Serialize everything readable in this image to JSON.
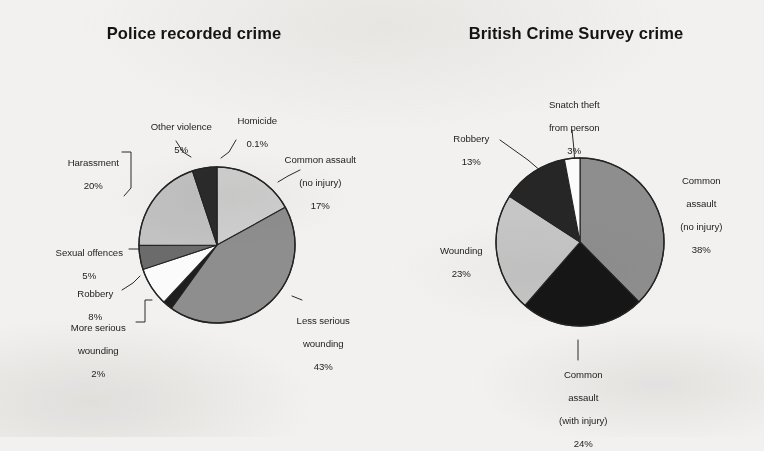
{
  "page": {
    "background_color": "#f2f1ef",
    "ink_color": "#1b1b1b"
  },
  "charts": [
    {
      "id": "police-recorded-crime",
      "title": "Police recorded crime",
      "slices": [
        {
          "label_line1": "Common assault",
          "label_line2": "(no injury)",
          "value_text": "17%",
          "value": 17,
          "color": "#cfcfcf"
        },
        {
          "label_line1": "Less serious",
          "label_line2": "wounding",
          "value_text": "43%",
          "value": 43,
          "color": "#8e8e8e"
        },
        {
          "label_line1": "More serious",
          "label_line2": "wounding",
          "value_text": "2%",
          "value": 2,
          "color": "#1e1e1e"
        },
        {
          "label_line1": "Robbery",
          "label_line2": "",
          "value_text": "8%",
          "value": 8,
          "color": "#fbfbfb"
        },
        {
          "label_line1": "Sexual offences",
          "label_line2": "",
          "value_text": "5%",
          "value": 5,
          "color": "#6b6b6b"
        },
        {
          "label_line1": "Harassment",
          "label_line2": "",
          "value_text": "20%",
          "value": 20,
          "color": "#c2c2c2"
        },
        {
          "label_line1": "Other violence",
          "label_line2": "",
          "value_text": "5%",
          "value": 5,
          "color": "#2b2b2b"
        },
        {
          "label_line1": "Homicide",
          "label_line2": "",
          "value_text": "0.1%",
          "value": 0.1,
          "color": "#4a4a4a"
        }
      ]
    },
    {
      "id": "british-crime-survey-crime",
      "title": "British Crime Survey crime",
      "slices": [
        {
          "label_line1": "Common",
          "label_line2": "assault",
          "label_line3": "(no injury)",
          "value_text": "38%",
          "value": 38,
          "color": "#8e8e8e"
        },
        {
          "label_line1": "Common",
          "label_line2": "assault",
          "label_line3": "(with injury)",
          "value_text": "24%",
          "value": 24,
          "color": "#161616"
        },
        {
          "label_line1": "Wounding",
          "label_line2": "",
          "label_line3": "",
          "value_text": "23%",
          "value": 23,
          "color": "#c6c6c6"
        },
        {
          "label_line1": "Robbery",
          "label_line2": "",
          "label_line3": "",
          "value_text": "13%",
          "value": 13,
          "color": "#262626"
        },
        {
          "label_line1": "Snatch theft",
          "label_line2": "from person",
          "label_line3": "",
          "value_text": "3%",
          "value": 3,
          "color": "#fbfbfb"
        }
      ]
    }
  ],
  "chart_data": [
    {
      "type": "pie",
      "title": "Police recorded crime",
      "labels": [
        "Common assault (no injury)",
        "Less serious wounding",
        "More serious wounding",
        "Robbery",
        "Sexual offences",
        "Harassment",
        "Other violence",
        "Homicide"
      ],
      "values": [
        17,
        43,
        2,
        8,
        5,
        20,
        5,
        0.1
      ],
      "value_labels": [
        "17%",
        "43%",
        "2%",
        "8%",
        "5%",
        "20%",
        "5%",
        "0.1%"
      ],
      "colors": [
        "#cfcfcf",
        "#8e8e8e",
        "#1e1e1e",
        "#fbfbfb",
        "#6b6b6b",
        "#c2c2c2",
        "#2b2b2b",
        "#4a4a4a"
      ],
      "units": "percent",
      "start_angle_deg": 0,
      "direction": "clockwise",
      "legend": "none",
      "labels_position": "outside-with-leader-lines",
      "xlabel": "",
      "ylabel": ""
    },
    {
      "type": "pie",
      "title": "British Crime Survey crime",
      "labels": [
        "Common assault (no injury)",
        "Common assault (with injury)",
        "Wounding",
        "Robbery",
        "Snatch theft from person"
      ],
      "values": [
        38,
        24,
        23,
        13,
        3
      ],
      "value_labels": [
        "38%",
        "24%",
        "23%",
        "13%",
        "3%"
      ],
      "colors": [
        "#8e8e8e",
        "#161616",
        "#c6c6c6",
        "#262626",
        "#fbfbfb"
      ],
      "units": "percent",
      "start_angle_deg": 0,
      "direction": "clockwise",
      "legend": "none",
      "labels_position": "outside-with-leader-lines",
      "xlabel": "",
      "ylabel": ""
    }
  ]
}
